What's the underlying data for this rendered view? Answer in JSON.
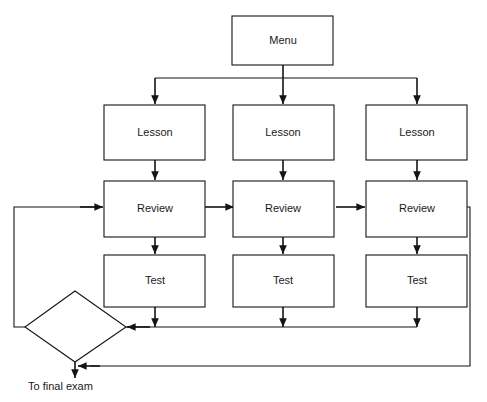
{
  "diagram": {
    "background_color": "#ffffff",
    "line_color": "#141414",
    "text_color": "#1a1a1a",
    "nodes": {
      "menu": {
        "label": "Menu",
        "shape": "rectangle"
      },
      "lesson_1": {
        "label": "Lesson",
        "shape": "rectangle"
      },
      "lesson_2": {
        "label": "Lesson",
        "shape": "rectangle"
      },
      "lesson_3": {
        "label": "Lesson",
        "shape": "rectangle"
      },
      "review_1": {
        "label": "Review",
        "shape": "rectangle"
      },
      "review_2": {
        "label": "Review",
        "shape": "rectangle"
      },
      "review_3": {
        "label": "Review",
        "shape": "rectangle"
      },
      "test_1": {
        "label": "Test",
        "shape": "rectangle"
      },
      "test_2": {
        "label": "Test",
        "shape": "rectangle"
      },
      "test_3": {
        "label": "Test",
        "shape": "rectangle"
      },
      "decision": {
        "label": "",
        "shape": "diamond"
      }
    },
    "captions": {
      "final_exam": "To final exam"
    }
  }
}
